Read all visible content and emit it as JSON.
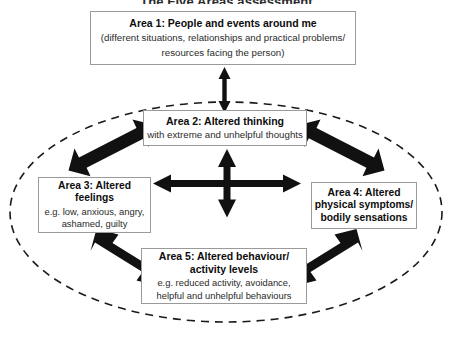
{
  "title": "The Five Areas assessment",
  "colors": {
    "box_border": "#9a9a9a",
    "arrow": "#111111",
    "ellipse": "#1a1a1a",
    "text": "#111111",
    "background": "#ffffff"
  },
  "areas": {
    "area1": {
      "title": "Area 1: People and events around me",
      "sub_line1": "(different situations, relationships and practical problems/",
      "sub_line2": "resources facing the person)"
    },
    "area2": {
      "title": "Area 2: Altered thinking",
      "sub_line1": "with extreme and unhelpful thoughts"
    },
    "area3": {
      "title_line1": "Area 3: Altered",
      "title_line2": "feelings",
      "sub_line1": "e.g. low, anxious, angry,",
      "sub_line2": "ashamed, guilty"
    },
    "area4": {
      "title_line1": "Area 4: Altered",
      "title_line2": "physical symptoms/",
      "title_line3": "bodily sensations"
    },
    "area5": {
      "title_line1": "Area 5: Altered behaviour/",
      "title_line2": "activity levels",
      "sub_line1": "e.g. reduced activity, avoidance,",
      "sub_line2": "helpful and unhelpful behaviours"
    }
  },
  "connectors": {
    "area1_to_area2": "vertical double-headed arrow",
    "area2_to_area3": "diagonal double-headed arrow",
    "area2_to_area4": "diagonal double-headed arrow",
    "area3_to_area5": "diagonal double-headed arrow",
    "area4_to_area5": "diagonal double-headed arrow",
    "center_cross": "four-way double-headed cross arrow linking all inner areas"
  },
  "ellipse": {
    "style": "dashed",
    "meaning": "inner system boundary enclosing areas 2 to 5"
  }
}
